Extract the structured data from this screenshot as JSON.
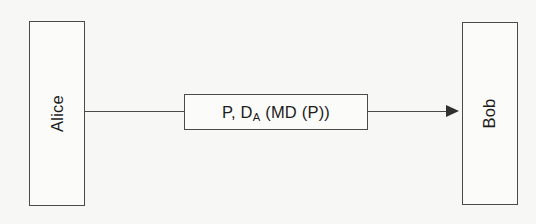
{
  "diagram": {
    "type": "protocol-message-flow",
    "background_color": "#f7f7f5",
    "line_color": "#4a4a4a",
    "text_color": "#1c1c1c",
    "sender": {
      "label": "Alice",
      "orientation": "vertical"
    },
    "receiver": {
      "label": "Bob",
      "orientation": "vertical"
    },
    "message": {
      "prefix": "P, D",
      "subscript": "A",
      "suffix": " (MD (P))",
      "full_text": "P, DA (MD (P))"
    },
    "arrow": {
      "direction": "left-to-right",
      "head_style": "solid-triangle"
    }
  }
}
